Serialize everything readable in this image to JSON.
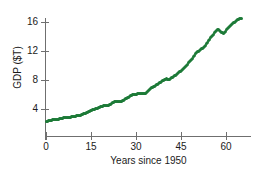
{
  "figure": {
    "top_cut_text": "",
    "series_color": "#1d7a38",
    "axis_color": "#6f6f6f",
    "text_color": "#1b1b1b",
    "background": "#ffffff"
  },
  "chart_data": {
    "type": "scatter",
    "title": "",
    "subtitle": "",
    "xlabel": "Years since 1950",
    "ylabel": "GDP ($T)",
    "xlim": [
      -1,
      68
    ],
    "ylim": [
      1.5,
      17.5
    ],
    "xticks": [
      0,
      15,
      30,
      45,
      60
    ],
    "xtick_labels": [
      "0",
      "15",
      "30",
      "45",
      "60"
    ],
    "yticks": [
      4,
      8,
      12,
      16
    ],
    "ytick_labels": [
      "4",
      "8",
      "12",
      "16"
    ],
    "grid": false,
    "legend": null,
    "marker": "circle",
    "marker_size_px": 3,
    "annotations": [],
    "x": [
      0,
      1,
      2,
      3,
      4,
      5,
      6,
      7,
      8,
      9,
      10,
      11,
      12,
      13,
      14,
      15,
      16,
      17,
      18,
      19,
      20,
      21,
      22,
      23,
      24,
      25,
      26,
      27,
      28,
      29,
      30,
      31,
      32,
      33,
      34,
      35,
      36,
      37,
      38,
      39,
      40,
      41,
      42,
      43,
      44,
      45,
      46,
      47,
      48,
      49,
      50,
      51,
      52,
      53,
      54,
      55,
      56,
      57,
      58,
      59,
      60,
      61,
      62,
      63,
      64,
      65
    ],
    "values": [
      2.3,
      2.4,
      2.5,
      2.6,
      2.6,
      2.7,
      2.8,
      2.85,
      2.85,
      3.0,
      3.05,
      3.1,
      3.3,
      3.4,
      3.6,
      3.8,
      4.0,
      4.1,
      4.3,
      4.45,
      4.45,
      4.6,
      4.85,
      5.1,
      5.05,
      5.05,
      5.3,
      5.55,
      5.85,
      6.05,
      6.05,
      6.2,
      6.15,
      6.2,
      6.6,
      6.9,
      7.15,
      7.4,
      7.7,
      8.0,
      8.15,
      8.1,
      8.4,
      8.65,
      9.0,
      9.35,
      9.75,
      10.2,
      10.7,
      11.2,
      11.8,
      12.1,
      12.4,
      12.8,
      13.4,
      14.0,
      14.5,
      15.0,
      14.7,
      14.4,
      14.9,
      15.4,
      15.8,
      16.1,
      16.4,
      16.55
    ]
  },
  "axes": {
    "y_tick_values": [
      16,
      12,
      8,
      4
    ],
    "x_tick_values": [
      0,
      15,
      30,
      45,
      60
    ]
  }
}
